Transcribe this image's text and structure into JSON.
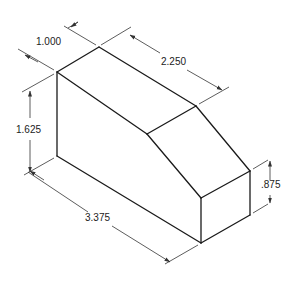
{
  "drawing": {
    "type": "isometric-part-drawing",
    "units": "inches",
    "line_color": "#1a1a1a",
    "background": "#ffffff"
  },
  "dimensions": {
    "depth": "1.000",
    "top_length": "2.250",
    "height": "1.625",
    "total_length": "3.375",
    "short_height": ".875"
  }
}
